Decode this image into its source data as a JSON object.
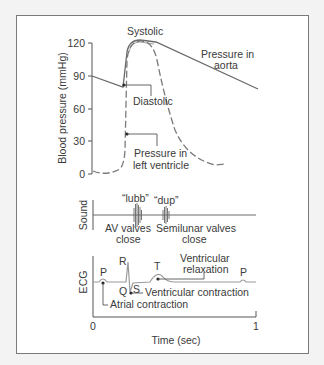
{
  "figure": {
    "pressure_panel": {
      "ylabel": "Blood pressure (mmHg)",
      "yticks": [
        "120",
        "90",
        "60",
        "30",
        "0"
      ],
      "labels": {
        "systolic": "Systolic",
        "diastolic": "Diastolic",
        "aorta_line1": "Pressure in",
        "aorta_line2": "aorta",
        "ventricle_line1": "Pressure in",
        "ventricle_line2": "left ventricle"
      }
    },
    "sound_panel": {
      "ylabel": "Sound",
      "lubb": "“lubb”",
      "dup": "“dup”",
      "av_line1": "AV valves",
      "av_line2": "close",
      "semilunar_line1": "Semilunar valves",
      "semilunar_line2": "close"
    },
    "ecg_panel": {
      "ylabel": "ECG",
      "wave_p": "P",
      "wave_q": "Q",
      "wave_r": "R",
      "wave_s": "S",
      "wave_t": "T",
      "wave_p2": "P",
      "ventricular_relaxation_line1": "Ventricular",
      "ventricular_relaxation_line2": "relaxation",
      "ventricular_contraction": "Ventricular  contraction",
      "atrial_contraction": "Atrial contraction",
      "xticks": [
        "0",
        "1"
      ],
      "xlabel": "Time (sec)"
    },
    "colors": {
      "background": "#f3f3f3",
      "panel": "#ffffff",
      "line": "#6a6a6a",
      "text": "#3a3a3a"
    }
  }
}
